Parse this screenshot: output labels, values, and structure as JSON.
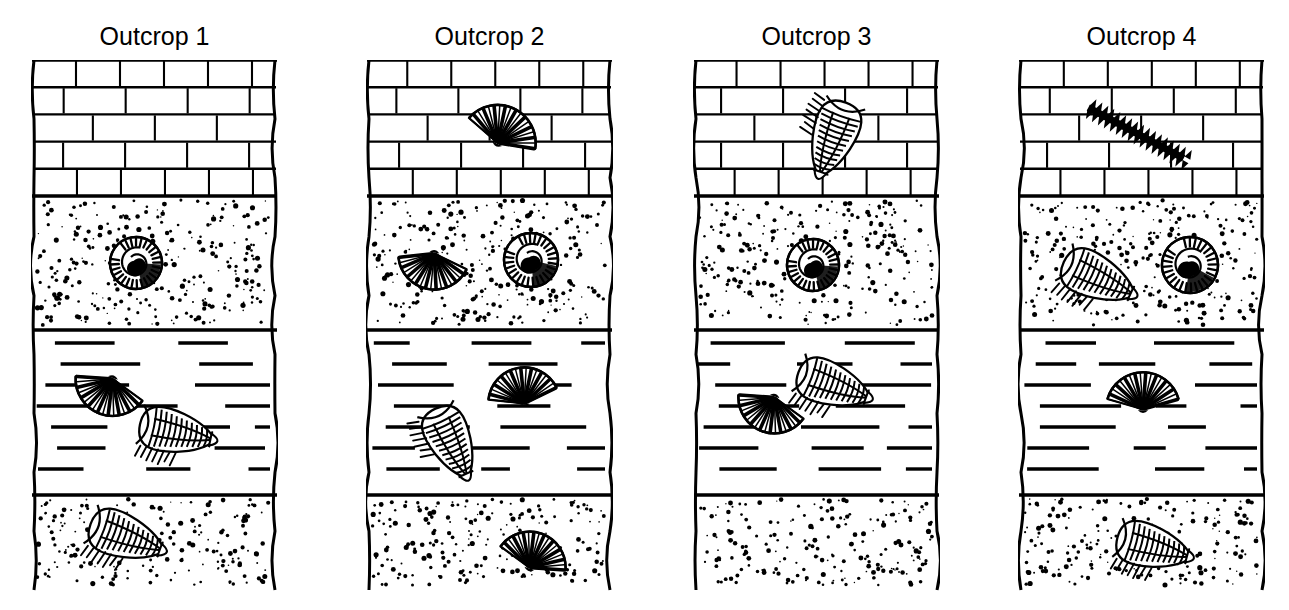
{
  "figure": {
    "type": "stratigraphic-column-correlation",
    "background_color": "#ffffff",
    "ink_color": "#000000",
    "width": 1289,
    "height": 610,
    "column_count": 4
  },
  "rock_units": [
    {
      "id": "limestone",
      "name": "Limestone",
      "pattern": "brick",
      "pattern_description": "interlocking rectangular brick courses"
    },
    {
      "id": "sandstone_upper",
      "name": "Sandstone (upper)",
      "pattern": "stipple",
      "pattern_description": "random dot stipple"
    },
    {
      "id": "shale",
      "name": "Shale",
      "pattern": "dashes",
      "pattern_description": "horizontal broken dash lines"
    },
    {
      "id": "sandstone_lower",
      "name": "Sandstone (lower)",
      "pattern": "stipple",
      "pattern_description": "random dot stipple"
    }
  ],
  "fossil_types": [
    {
      "id": "brachiopod",
      "name": "Brachiopod",
      "shape": "fan-shaped ribbed shell"
    },
    {
      "id": "ammonite",
      "name": "Ammonite",
      "shape": "coiled spiral shell"
    },
    {
      "id": "trilobite",
      "name": "Trilobite",
      "shape": "segmented oval arthropod"
    },
    {
      "id": "graptolite",
      "name": "Graptolite",
      "shape": "dark saw-toothed elongated branch"
    }
  ],
  "outcrops": [
    {
      "label": "Outcrop 1",
      "x": 31,
      "layers": [
        {
          "unit": "limestone",
          "top": 0,
          "bottom": 136,
          "brick_rows": 5
        },
        {
          "unit": "sandstone_upper",
          "top": 136,
          "bottom": 270
        },
        {
          "unit": "shale",
          "top": 270,
          "bottom": 435
        },
        {
          "unit": "sandstone_lower",
          "top": 435,
          "bottom": 530
        }
      ],
      "fossils": [
        {
          "type": "ammonite",
          "unit": "sandstone_upper",
          "cx": 105,
          "cy": 203,
          "size": 52,
          "rotation": -10
        },
        {
          "type": "brachiopod",
          "unit": "shale",
          "cx": 75,
          "cy": 337,
          "size": 74,
          "rotation": 200
        },
        {
          "type": "trilobite",
          "unit": "shale",
          "cx": 145,
          "cy": 372,
          "size": 80,
          "rotation": 12
        },
        {
          "type": "trilobite",
          "unit": "sandstone_lower",
          "cx": 95,
          "cy": 477,
          "size": 82,
          "rotation": 20
        }
      ]
    },
    {
      "label": "Outcrop 2",
      "x": 366,
      "layers": [
        {
          "unit": "limestone",
          "top": 0,
          "bottom": 136,
          "brick_rows": 5
        },
        {
          "unit": "sandstone_upper",
          "top": 136,
          "bottom": 270
        },
        {
          "unit": "shale",
          "top": 270,
          "bottom": 435
        },
        {
          "unit": "sandstone_lower",
          "top": 435,
          "bottom": 530
        }
      ],
      "fossils": [
        {
          "type": "brachiopod",
          "unit": "limestone",
          "cx": 140,
          "cy": 65,
          "size": 76,
          "rotation": 25
        },
        {
          "type": "brachiopod",
          "unit": "sandstone_upper",
          "cx": 65,
          "cy": 212,
          "size": 72,
          "rotation": 190
        },
        {
          "type": "ammonite",
          "unit": "sandstone_upper",
          "cx": 165,
          "cy": 200,
          "size": 54,
          "rotation": 0
        },
        {
          "type": "brachiopod",
          "unit": "shale",
          "cx": 155,
          "cy": 325,
          "size": 72,
          "rotation": 350
        },
        {
          "type": "trilobite",
          "unit": "shale",
          "cx": 85,
          "cy": 382,
          "size": 80,
          "rotation": 65
        },
        {
          "type": "brachiopod",
          "unit": "sandstone_lower",
          "cx": 170,
          "cy": 490,
          "size": 72,
          "rotation": 20
        }
      ]
    },
    {
      "label": "Outcrop 3",
      "x": 693,
      "layers": [
        {
          "unit": "limestone",
          "top": 0,
          "bottom": 136,
          "brick_rows": 5
        },
        {
          "unit": "sandstone_upper",
          "top": 136,
          "bottom": 270
        },
        {
          "unit": "shale",
          "top": 270,
          "bottom": 435
        },
        {
          "unit": "sandstone_lower",
          "top": 435,
          "bottom": 530
        }
      ],
      "fossils": [
        {
          "type": "trilobite",
          "unit": "limestone",
          "cx": 140,
          "cy": 78,
          "size": 82,
          "rotation": 110
        },
        {
          "type": "ammonite",
          "unit": "sandstone_upper",
          "cx": 120,
          "cy": 205,
          "size": 52,
          "rotation": -10
        },
        {
          "type": "trilobite",
          "unit": "shale",
          "cx": 140,
          "cy": 325,
          "size": 80,
          "rotation": 20
        },
        {
          "type": "brachiopod",
          "unit": "shale",
          "cx": 75,
          "cy": 355,
          "size": 72,
          "rotation": 200
        }
      ]
    },
    {
      "label": "Outcrop 4",
      "x": 1018,
      "layers": [
        {
          "unit": "limestone",
          "top": 0,
          "bottom": 136,
          "brick_rows": 5
        },
        {
          "unit": "sandstone_upper",
          "top": 136,
          "bottom": 270
        },
        {
          "unit": "shale",
          "top": 270,
          "bottom": 435
        },
        {
          "unit": "sandstone_lower",
          "top": 435,
          "bottom": 530
        }
      ],
      "fossils": [
        {
          "type": "graptolite",
          "unit": "limestone",
          "cx": 118,
          "cy": 73,
          "size": 108,
          "rotation": 28
        },
        {
          "type": "trilobite",
          "unit": "sandstone_upper",
          "cx": 80,
          "cy": 218,
          "size": 82,
          "rotation": 25
        },
        {
          "type": "ammonite",
          "unit": "sandstone_upper",
          "cx": 172,
          "cy": 205,
          "size": 56,
          "rotation": 15
        },
        {
          "type": "brachiopod",
          "unit": "shale",
          "cx": 125,
          "cy": 330,
          "size": 74,
          "rotation": 0
        },
        {
          "type": "trilobite",
          "unit": "sandstone_lower",
          "cx": 135,
          "cy": 487,
          "size": 80,
          "rotation": 15
        }
      ]
    }
  ]
}
